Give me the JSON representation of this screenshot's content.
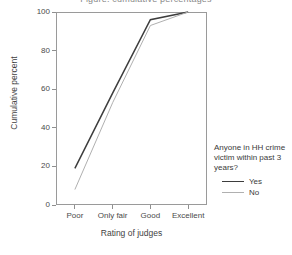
{
  "chart_data": {
    "type": "line",
    "title": "Figure: cumulative percentages",
    "xlabel": "Rating of judges",
    "ylabel": "Cumulative percent",
    "categories": [
      "Poor",
      "Only fair",
      "Good",
      "Excellent"
    ],
    "x_tick_labels": [
      "Poor",
      "Only fair",
      "Good",
      "Excellent"
    ],
    "y_tick_labels": [
      "0",
      "20",
      "40",
      "60",
      "80",
      "100"
    ],
    "y_ticks": [
      0,
      20,
      40,
      60,
      80,
      100
    ],
    "ylim": [
      0,
      100
    ],
    "grid": false,
    "legend_position": "right",
    "legend_title": "Anyone in HH crime victim within past 3 years?",
    "series": [
      {
        "name": "Yes",
        "color": "#3d3d3d",
        "width": 1.5,
        "values": [
          19,
          58,
          96,
          100
        ]
      },
      {
        "name": "No",
        "color": "#b0b0b0",
        "width": 1.0,
        "values": [
          8,
          53,
          93,
          100
        ]
      }
    ]
  },
  "axes": {
    "y_title": "Cumulative percent",
    "x_title": "Rating of judges",
    "y_labels": [
      "100",
      "80",
      "60",
      "40",
      "20",
      "0"
    ],
    "x_labels": [
      "Poor",
      "Only fair",
      "Good",
      "Excellent"
    ]
  },
  "legend": {
    "title": "Anyone in HH crime victim within past 3 years?",
    "items": [
      {
        "label": "Yes",
        "color": "#3d3d3d",
        "width": "1.6px"
      },
      {
        "label": "No",
        "color": "#b0b0b0",
        "width": "1.0px"
      }
    ]
  },
  "title": {
    "text": "Figure: cumulative percentages"
  }
}
